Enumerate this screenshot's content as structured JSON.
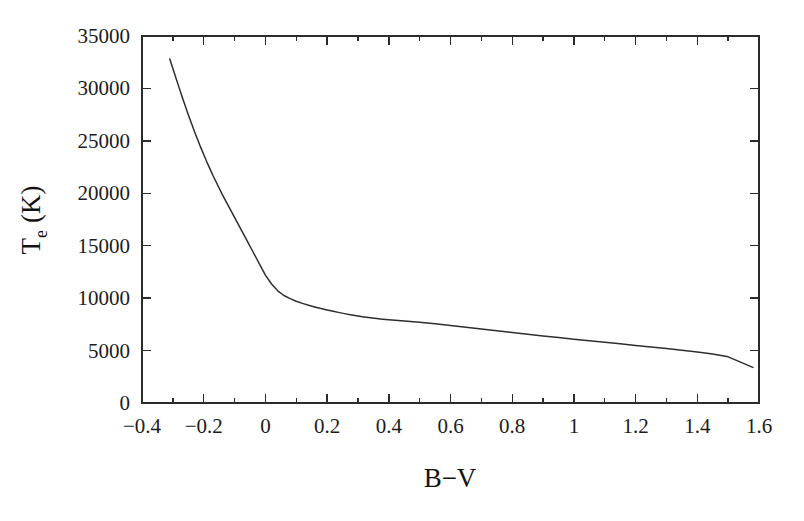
{
  "figure": {
    "background_color": "#ffffff",
    "line_color": "#2e2e2e",
    "axis_color": "#2b2b2b"
  },
  "chart_data": {
    "type": "line",
    "title": "",
    "subtitle": "",
    "xlabel": "B−V",
    "ylabel": "T",
    "ylabel_subscript": "e",
    "ylabel_unit": "(K)",
    "ylabel_full": "Tₑ (K)",
    "xlim": [
      -0.4,
      1.6
    ],
    "ylim": [
      0,
      35000
    ],
    "xticks": [
      -0.4,
      -0.2,
      0,
      0.2,
      0.4,
      0.6,
      0.8,
      1,
      1.2,
      1.4,
      1.6
    ],
    "xtick_labels": [
      "−0.4",
      "−0.2",
      "0",
      "0.2",
      "0.4",
      "0.6",
      "0.8",
      "1",
      "1.2",
      "1.4",
      "1.6"
    ],
    "xminor_ticks": [
      -0.3,
      -0.1,
      0.1,
      0.3,
      0.5,
      0.7,
      0.9,
      1.1,
      1.3,
      1.5
    ],
    "yticks": [
      0,
      5000,
      10000,
      15000,
      20000,
      25000,
      30000,
      35000
    ],
    "ytick_labels": [
      "0",
      "5000",
      "10000",
      "15000",
      "20000",
      "25000",
      "30000",
      "35000"
    ],
    "grid": false,
    "legend": null,
    "annotations": [],
    "series": [
      {
        "name": "Effective temperature vs colour index",
        "x": [
          -0.31,
          -0.3,
          -0.29,
          -0.28,
          -0.27,
          -0.26,
          -0.25,
          -0.24,
          -0.23,
          -0.22,
          -0.21,
          -0.2,
          -0.19,
          -0.18,
          -0.17,
          -0.16,
          -0.15,
          -0.14,
          -0.13,
          -0.12,
          -0.11,
          -0.1,
          -0.09,
          -0.08,
          -0.07,
          -0.06,
          -0.05,
          -0.04,
          -0.03,
          -0.02,
          -0.01,
          0.0,
          0.02,
          0.04,
          0.06,
          0.08,
          0.1,
          0.12,
          0.14,
          0.16,
          0.18,
          0.2,
          0.22,
          0.24,
          0.26,
          0.28,
          0.3,
          0.32,
          0.34,
          0.36,
          0.38,
          0.4,
          0.45,
          0.5,
          0.55,
          0.6,
          0.65,
          0.7,
          0.75,
          0.8,
          0.85,
          0.9,
          0.95,
          1.0,
          1.05,
          1.1,
          1.15,
          1.2,
          1.25,
          1.3,
          1.35,
          1.4,
          1.45,
          1.5,
          1.54,
          1.58
        ],
        "y": [
          32800,
          31900,
          31000,
          30100,
          29200,
          28350,
          27500,
          26700,
          25900,
          25150,
          24400,
          23700,
          23000,
          22350,
          21700,
          21100,
          20500,
          19900,
          19350,
          18800,
          18250,
          17700,
          17150,
          16600,
          16050,
          15500,
          14950,
          14400,
          13850,
          13300,
          12750,
          12200,
          11350,
          10700,
          10250,
          9950,
          9700,
          9500,
          9320,
          9160,
          9010,
          8870,
          8740,
          8620,
          8500,
          8390,
          8290,
          8200,
          8120,
          8050,
          7990,
          7940,
          7820,
          7700,
          7560,
          7400,
          7230,
          7060,
          6890,
          6720,
          6560,
          6400,
          6240,
          6090,
          5940,
          5790,
          5640,
          5490,
          5340,
          5190,
          5030,
          4860,
          4670,
          4400,
          3900,
          3400
        ],
        "style": "solid",
        "color": "#2e2e2e"
      }
    ]
  }
}
